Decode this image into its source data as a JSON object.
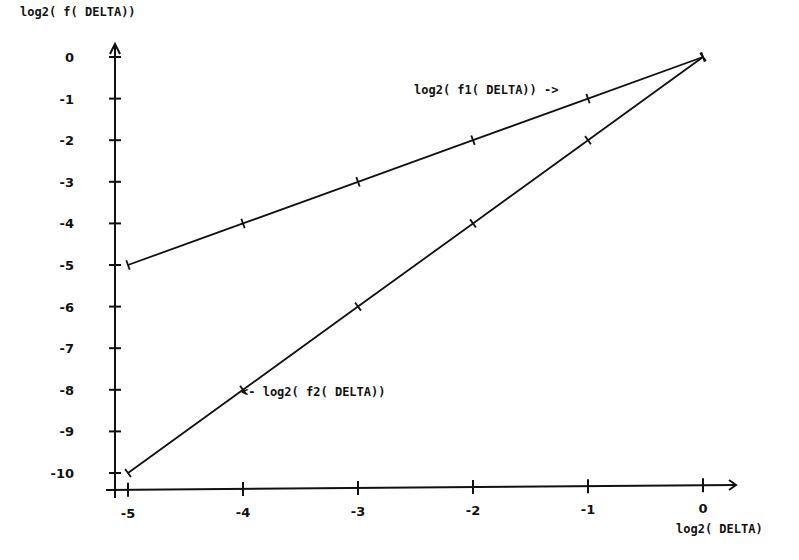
{
  "chart_data": {
    "type": "line",
    "title": "",
    "xlabel": "log2(DELTA)",
    "ylabel": "log2(f(DELTA))",
    "x": [
      -5,
      -4,
      -3,
      -2,
      -1,
      0
    ],
    "xticks": [
      "-5",
      "-4",
      "-3",
      "-2",
      "-1",
      "0"
    ],
    "yticks": [
      "0",
      "-1",
      "-2",
      "-3",
      "-4",
      "-5",
      "-6",
      "-7",
      "-8",
      "-9",
      "-10"
    ],
    "xlim": [
      -5,
      0
    ],
    "ylim": [
      -10,
      0
    ],
    "grid": false,
    "legend": "none (inline annotations)",
    "series": [
      {
        "name": "log2(f1(DELTA))",
        "values": [
          -5,
          -4,
          -3,
          -2,
          -1,
          0
        ]
      },
      {
        "name": "log2(f2(DELTA))",
        "values": [
          -10,
          -8,
          -6,
          -4,
          -2,
          0
        ]
      }
    ],
    "annotations": [
      {
        "text": "log2(f1(DELTA)) ->",
        "series": "log2(f1(DELTA))",
        "near_x": -1
      },
      {
        "text": "<- log2(f2(DELTA))",
        "series": "log2(f2(DELTA))",
        "near_x": -4
      }
    ]
  },
  "labels": {
    "ylabel": "log2( f( DELTA))",
    "xlabel": "log2( DELTA)",
    "f1_annotation": "log2( f1( DELTA)) ->",
    "f2_annotation": "<- log2( f2( DELTA))"
  },
  "colors": {
    "line": "#111111",
    "background": "#ffffff"
  }
}
